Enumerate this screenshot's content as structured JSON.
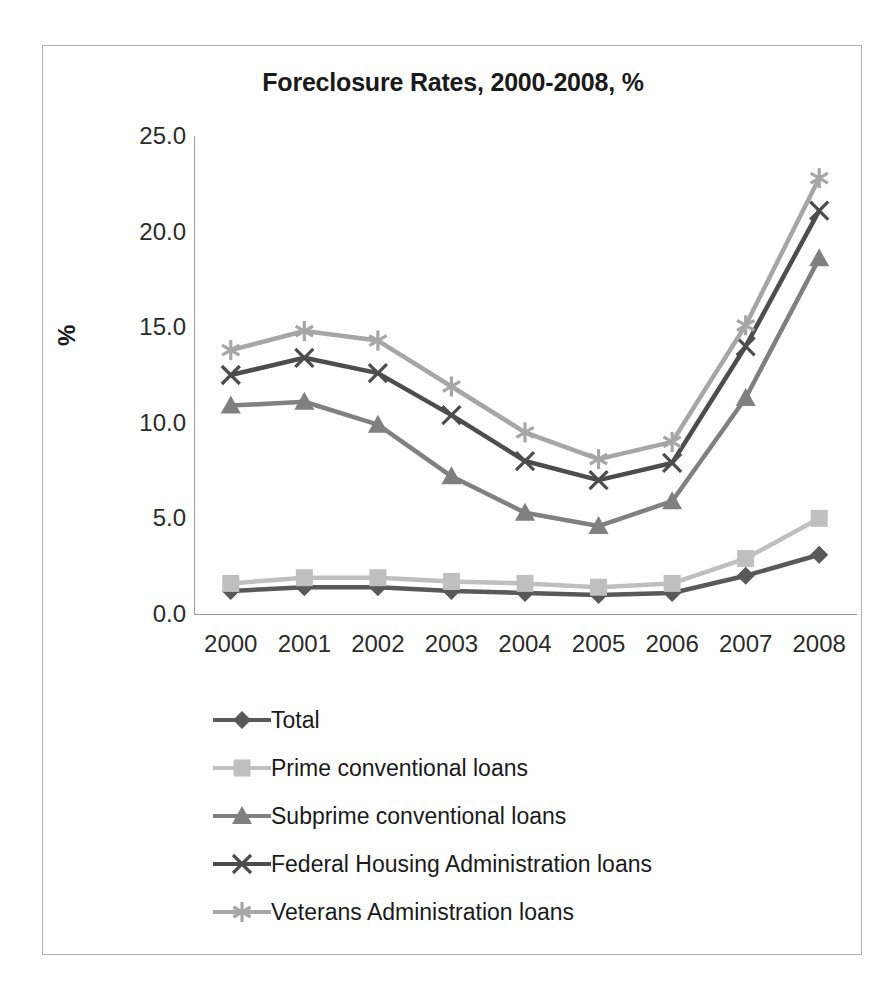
{
  "chart_data": {
    "type": "line",
    "title": "Foreclosure Rates, 2000-2008, %",
    "xlabel": "",
    "ylabel": "%",
    "categories": [
      "2000",
      "2001",
      "2002",
      "2003",
      "2004",
      "2005",
      "2006",
      "2007",
      "2008"
    ],
    "x": [
      2000,
      2001,
      2002,
      2003,
      2004,
      2005,
      2006,
      2007,
      2008
    ],
    "ylim": [
      0.0,
      25.0
    ],
    "yticks": [
      "0.0",
      "5.0",
      "10.0",
      "15.0",
      "20.0",
      "25.0"
    ],
    "ytick_values": [
      0.0,
      5.0,
      10.0,
      15.0,
      20.0,
      25.0
    ],
    "grid": false,
    "legend_position": "bottom",
    "series": [
      {
        "name": "Total",
        "marker": "diamond",
        "color": "#595959",
        "values": [
          1.2,
          1.4,
          1.4,
          1.2,
          1.1,
          1.0,
          1.1,
          2.0,
          3.1
        ]
      },
      {
        "name": "Prime conventional loans",
        "marker": "square",
        "color": "#bfbfbf",
        "values": [
          1.6,
          1.9,
          1.9,
          1.7,
          1.6,
          1.4,
          1.6,
          2.9,
          5.0
        ]
      },
      {
        "name": "Subprime conventional loans",
        "marker": "triangle",
        "color": "#808080",
        "values": [
          10.9,
          11.1,
          9.9,
          7.2,
          5.3,
          4.6,
          5.9,
          11.3,
          18.6
        ]
      },
      {
        "name": "Federal Housing Administration loans",
        "marker": "x",
        "color": "#4d4d4d",
        "values": [
          12.5,
          13.4,
          12.6,
          10.4,
          8.0,
          7.0,
          7.9,
          14.0,
          21.1
        ]
      },
      {
        "name": "Veterans Administration loans",
        "marker": "asterisk",
        "color": "#a6a6a6",
        "values": [
          13.8,
          14.8,
          14.3,
          11.9,
          9.5,
          8.1,
          9.0,
          15.1,
          22.8
        ]
      }
    ]
  },
  "legend": [
    {
      "label": "Total"
    },
    {
      "label": "Prime conventional loans"
    },
    {
      "label": "Subprime conventional loans"
    },
    {
      "label": "Federal Housing Administration loans"
    },
    {
      "label": "Veterans Administration loans"
    }
  ]
}
